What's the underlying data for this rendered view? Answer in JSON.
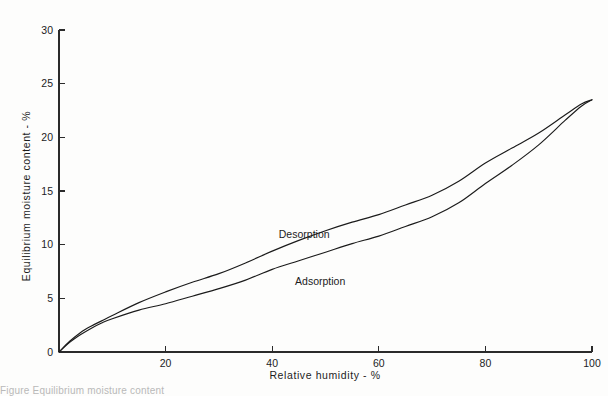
{
  "figure": {
    "background_color": "#fdfdfc",
    "ink_color": "#1b1b1b",
    "caption_partial": "Figure  Equilibrium moisture content"
  },
  "chart_data": {
    "type": "line",
    "title": "",
    "xlabel": "Relative   humidity  -  %",
    "ylabel": "Equilibrium   moisture   content  -  %",
    "xlim": [
      0,
      100
    ],
    "ylim": [
      0,
      30
    ],
    "grid": false,
    "legend_position": "inline-curve-labels",
    "xticks": [
      0,
      20,
      40,
      60,
      80,
      100
    ],
    "xtick_labels": [
      "",
      "20",
      "40",
      "60",
      "80",
      "100"
    ],
    "yticks": [
      0,
      5,
      10,
      15,
      20,
      25,
      30
    ],
    "ytick_labels": [
      "0",
      "5",
      "10",
      "15",
      "20",
      "25",
      "30"
    ],
    "x": [
      0,
      2,
      4,
      6,
      8,
      10,
      15,
      20,
      25,
      30,
      35,
      40,
      45,
      50,
      55,
      60,
      65,
      70,
      75,
      80,
      85,
      90,
      95,
      98,
      100
    ],
    "series": [
      {
        "name": "Desorption",
        "label_x": 46,
        "label_y": 10.6,
        "values": [
          0.0,
          1.0,
          1.8,
          2.4,
          2.9,
          3.4,
          4.6,
          5.6,
          6.5,
          7.3,
          8.3,
          9.4,
          10.4,
          11.3,
          12.1,
          12.8,
          13.7,
          14.6,
          15.9,
          17.6,
          19.0,
          20.4,
          22.1,
          23.1,
          23.5
        ]
      },
      {
        "name": "Adsorption",
        "label_x": 49,
        "label_y": 6.2,
        "values": [
          0.0,
          0.9,
          1.6,
          2.2,
          2.7,
          3.1,
          3.9,
          4.5,
          5.2,
          5.9,
          6.7,
          7.7,
          8.5,
          9.3,
          10.1,
          10.8,
          11.7,
          12.6,
          13.9,
          15.7,
          17.4,
          19.3,
          21.6,
          22.9,
          23.5
        ]
      }
    ],
    "annotations": [
      {
        "text": "Desorption",
        "x": 46,
        "y": 10.6
      },
      {
        "text": "Adsorption",
        "x": 49,
        "y": 6.2
      }
    ]
  }
}
